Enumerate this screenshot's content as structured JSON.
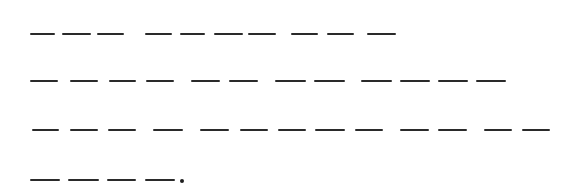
{
  "puzzle": {
    "description": "Blank letter placeholders (one dash per letter) arranged into words across four lines, ending with a period.",
    "ink_color": "#2a2a2a",
    "background_color": "#ffffff",
    "lines": [
      {
        "y": 34,
        "word_letter_counts": [
          3,
          4,
          2,
          1
        ],
        "dashes": [
          [
            [
              30,
              55
            ],
            [
              62,
              91
            ],
            [
              97,
              124
            ]
          ],
          [
            [
              145,
              172
            ],
            [
              180,
              205
            ],
            [
              214,
              243
            ],
            [
              248,
              276
            ]
          ],
          [
            [
              291,
              318
            ],
            [
              327,
              354
            ]
          ],
          [
            [
              367,
              396
            ]
          ]
        ]
      },
      {
        "y": 81,
        "word_letter_counts": [
          4,
          2,
          2,
          4
        ],
        "dashes": [
          [
            [
              30,
              58
            ],
            [
              70,
              98
            ],
            [
              109,
              136
            ],
            [
              146,
              174
            ]
          ],
          [
            [
              191,
              220
            ],
            [
              229,
              258
            ]
          ],
          [
            [
              275,
              306
            ],
            [
              314,
              345
            ]
          ],
          [
            [
              361,
              392
            ],
            [
              400,
              430
            ],
            [
              438,
              468
            ],
            [
              476,
              506
            ]
          ]
        ]
      },
      {
        "y": 130,
        "word_letter_counts": [
          3,
          1,
          5,
          2,
          2
        ],
        "dashes": [
          [
            [
              32,
              59
            ],
            [
              70,
              98
            ],
            [
              108,
              136
            ]
          ],
          [
            [
              153,
              183
            ]
          ],
          [
            [
              200,
              229
            ],
            [
              240,
              268
            ],
            [
              278,
              306
            ],
            [
              315,
              345
            ],
            [
              355,
              383
            ]
          ],
          [
            [
              400,
              429
            ],
            [
              438,
              467
            ]
          ],
          [
            [
              484,
              512
            ],
            [
              522,
              550
            ]
          ]
        ]
      },
      {
        "y": 180,
        "word_letter_counts": [
          4
        ],
        "dashes": [
          [
            [
              30,
              60
            ],
            [
              68,
              99
            ],
            [
              107,
              136
            ],
            [
              145,
              175
            ]
          ]
        ],
        "terminal_punctuation": {
          "char": ".",
          "x": 182,
          "y": 181
        }
      }
    ]
  }
}
